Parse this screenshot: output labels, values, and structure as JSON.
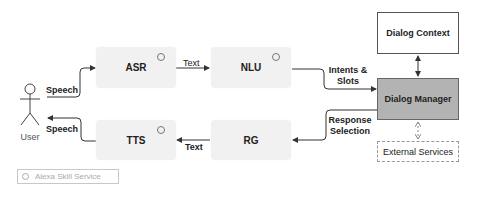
{
  "diagram": {
    "actor": {
      "label": "User"
    },
    "components": {
      "asr": {
        "label": "ASR"
      },
      "nlu": {
        "label": "NLU"
      },
      "tts": {
        "label": "TTS"
      },
      "rg": {
        "label": "RG"
      },
      "dialog_manager": {
        "label": "Dialog Manager"
      },
      "dialog_context": {
        "label": "Dialog Context"
      },
      "external_services": {
        "label": "External Services"
      }
    },
    "edges": {
      "user_to_asr": "Speech",
      "asr_to_nlu": "Text",
      "nlu_to_dm": "Intents &\nSlots",
      "nlu_to_dm_line1": "Intents &",
      "nlu_to_dm_line2": "Slots",
      "dm_to_rg_line1": "Response",
      "dm_to_rg_line2": "Selection",
      "rg_to_tts": "Text",
      "tts_to_user": "Speech"
    },
    "legend": {
      "label": "Alexa Skill Service"
    },
    "colors": {
      "service_fill": "#f1f1f1",
      "dialog_manager_fill": "#b3b3b3",
      "edge": "#333333"
    }
  }
}
